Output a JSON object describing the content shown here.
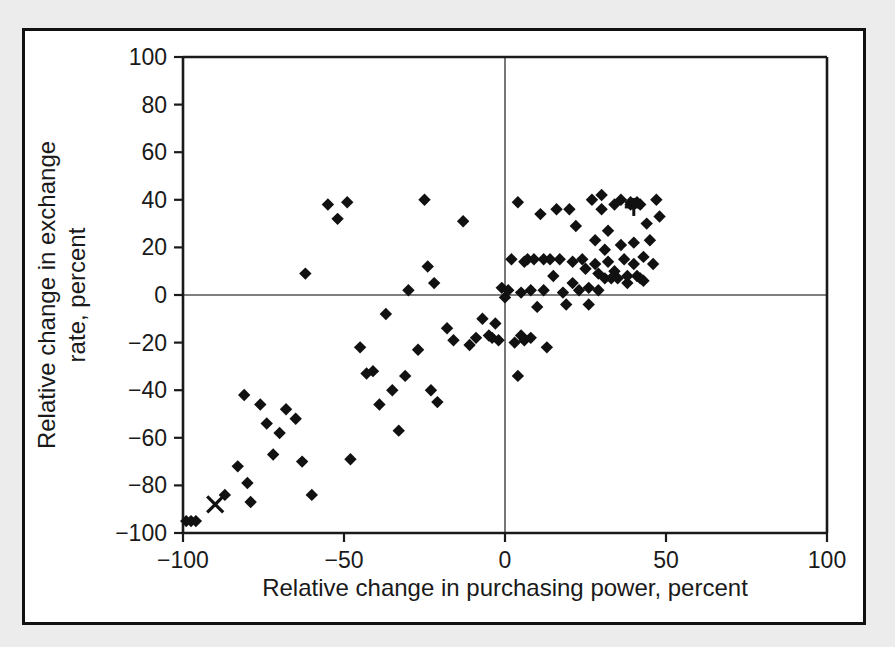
{
  "figure": {
    "background_color": "#ececec",
    "panel_color": "#ffffff",
    "border_color": "#111111",
    "marker_color": "#111111"
  },
  "chart_data": {
    "type": "scatter",
    "title": "",
    "xlabel": "Relative change in purchasing power, percent",
    "ylabel": "Relative change in exchange rate, percent",
    "xlim": [
      -100,
      100
    ],
    "ylim": [
      -100,
      100
    ],
    "xticks": [
      -100,
      -50,
      0,
      50,
      100
    ],
    "yticks": [
      -100,
      -80,
      -60,
      -40,
      -20,
      0,
      20,
      40,
      60,
      80,
      100
    ],
    "xtick_labels": [
      "-100",
      "-50",
      "0",
      "50",
      "100"
    ],
    "ytick_labels": [
      "-100",
      "-80",
      "-60",
      "-40",
      "-20",
      "0",
      "20",
      "40",
      "60",
      "80",
      "100"
    ],
    "grid": false,
    "legend": null,
    "zero_lines": {
      "x": 0,
      "y": 0
    },
    "series": [
      {
        "name": "countries-diamond",
        "marker": "diamond",
        "points": [
          [
            -99,
            -95
          ],
          [
            -97.5,
            -95
          ],
          [
            -96,
            -95
          ],
          [
            -87,
            -84
          ],
          [
            -83,
            -72
          ],
          [
            -81,
            -42
          ],
          [
            -80,
            -79
          ],
          [
            -79,
            -87
          ],
          [
            -76,
            -46
          ],
          [
            -74,
            -54
          ],
          [
            -72,
            -67
          ],
          [
            -70,
            -58
          ],
          [
            -68,
            -48
          ],
          [
            -65,
            -52
          ],
          [
            -63,
            -70
          ],
          [
            -62,
            9
          ],
          [
            -60,
            -84
          ],
          [
            -55,
            38
          ],
          [
            -52,
            32
          ],
          [
            -49,
            39
          ],
          [
            -48,
            -69
          ],
          [
            -45,
            -22
          ],
          [
            -43,
            -33
          ],
          [
            -41,
            -32
          ],
          [
            -39,
            -46
          ],
          [
            -37,
            -8
          ],
          [
            -35,
            -40
          ],
          [
            -33,
            -57
          ],
          [
            -31,
            -34
          ],
          [
            -30,
            2
          ],
          [
            -27,
            -23
          ],
          [
            -25,
            40
          ],
          [
            -24,
            12
          ],
          [
            -23,
            -40
          ],
          [
            -22,
            5
          ],
          [
            -21,
            -45
          ],
          [
            -18,
            -14
          ],
          [
            -16,
            -19
          ],
          [
            -13,
            31
          ],
          [
            -11,
            -21
          ],
          [
            -9,
            -18
          ],
          [
            -7,
            -10
          ],
          [
            -5,
            -17
          ],
          [
            -4,
            -18
          ],
          [
            -3,
            -12
          ],
          [
            -2,
            -19
          ],
          [
            -1,
            3
          ],
          [
            0,
            -1
          ],
          [
            1,
            2
          ],
          [
            2,
            15
          ],
          [
            3,
            -20
          ],
          [
            4,
            39
          ],
          [
            4,
            -34
          ],
          [
            5,
            1
          ],
          [
            5,
            -17
          ],
          [
            6,
            14
          ],
          [
            6,
            -19
          ],
          [
            7,
            15
          ],
          [
            8,
            2
          ],
          [
            8,
            -18
          ],
          [
            9,
            15
          ],
          [
            10,
            -5
          ],
          [
            11,
            34
          ],
          [
            12,
            15
          ],
          [
            12,
            2
          ],
          [
            13,
            -22
          ],
          [
            14,
            15
          ],
          [
            15,
            8
          ],
          [
            16,
            36
          ],
          [
            17,
            15
          ],
          [
            18,
            1
          ],
          [
            19,
            -4
          ],
          [
            20,
            36
          ],
          [
            21,
            14
          ],
          [
            21,
            5
          ],
          [
            22,
            29
          ],
          [
            23,
            2
          ],
          [
            24,
            15
          ],
          [
            25,
            11
          ],
          [
            26,
            3
          ],
          [
            26,
            -4
          ],
          [
            27,
            40
          ],
          [
            28,
            23
          ],
          [
            28,
            13
          ],
          [
            29,
            9
          ],
          [
            29,
            2
          ],
          [
            30,
            42
          ],
          [
            30,
            36
          ],
          [
            31,
            19
          ],
          [
            31,
            7
          ],
          [
            32,
            27
          ],
          [
            32,
            14
          ],
          [
            33,
            7
          ],
          [
            34,
            38
          ],
          [
            34,
            10
          ],
          [
            35,
            7
          ],
          [
            36,
            40
          ],
          [
            36,
            21
          ],
          [
            37,
            15
          ],
          [
            38,
            8
          ],
          [
            38,
            5
          ],
          [
            39,
            39
          ],
          [
            39,
            38
          ],
          [
            40,
            38
          ],
          [
            40,
            22
          ],
          [
            40,
            13
          ],
          [
            41,
            39
          ],
          [
            41,
            8
          ],
          [
            42,
            38
          ],
          [
            42,
            7
          ],
          [
            43,
            16
          ],
          [
            43,
            6
          ],
          [
            44,
            30
          ],
          [
            45,
            23
          ],
          [
            46,
            13
          ],
          [
            47,
            40
          ],
          [
            48,
            33
          ]
        ]
      },
      {
        "name": "outlier-cross",
        "marker": "x",
        "points": [
          [
            -90,
            -88
          ]
        ]
      },
      {
        "name": "outlier-plus",
        "marker": "plus",
        "points": [
          [
            40,
            37
          ]
        ]
      }
    ]
  }
}
